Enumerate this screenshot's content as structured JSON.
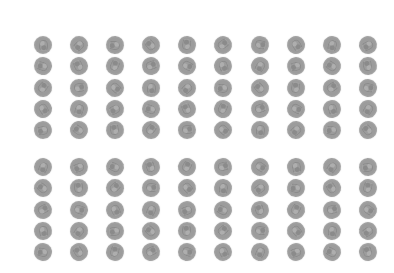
{
  "image": {
    "background_color": "#ffffff",
    "coin_color": "#9c9c9c",
    "coin_rim_color": "#c4c4c4"
  },
  "groups": [
    {
      "name": "top-group",
      "rows": 5,
      "columns": 10,
      "count": 50
    },
    {
      "name": "bottom-group",
      "rows": 5,
      "columns": 10,
      "count": 50
    }
  ],
  "total_coins": 100
}
